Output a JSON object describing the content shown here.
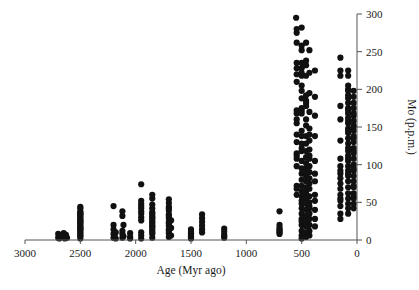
{
  "chart_data": {
    "type": "scatter",
    "title": "",
    "xlabel": "Age (Myr ago)",
    "ylabel": "Mo (p.p.m.)",
    "xlim": [
      3000,
      0
    ],
    "ylim": [
      0,
      300
    ],
    "x_reversed": true,
    "grid": false,
    "legend": null,
    "xticks": [
      3000,
      2500,
      2000,
      1500,
      1000,
      500,
      0
    ],
    "yticks": [
      0,
      50,
      100,
      150,
      200,
      250,
      300
    ],
    "xtick_labels": [
      "3000",
      "2500",
      "2000",
      "1500",
      "1000",
      "500",
      "0"
    ],
    "ytick_labels": [
      "0",
      "50",
      "100",
      "150",
      "200",
      "250",
      "300"
    ],
    "y_axis_position": "right",
    "marker": "filled-circle",
    "marker_color": "#111111",
    "marker_size": 3.1,
    "series": [
      {
        "name": "Mo concentration in black shales",
        "points": [
          [
            2700,
            3
          ],
          [
            2700,
            8
          ],
          [
            2690,
            2
          ],
          [
            2680,
            6
          ],
          [
            2660,
            4
          ],
          [
            2650,
            9
          ],
          [
            2640,
            2
          ],
          [
            2630,
            7
          ],
          [
            2620,
            3
          ],
          [
            2500,
            2
          ],
          [
            2500,
            6
          ],
          [
            2500,
            10
          ],
          [
            2500,
            14
          ],
          [
            2500,
            18
          ],
          [
            2500,
            22
          ],
          [
            2500,
            26
          ],
          [
            2500,
            30
          ],
          [
            2500,
            34
          ],
          [
            2500,
            38
          ],
          [
            2500,
            42
          ],
          [
            2500,
            8
          ],
          [
            2500,
            16
          ],
          [
            2500,
            24
          ],
          [
            2500,
            32
          ],
          [
            2500,
            12
          ],
          [
            2500,
            20
          ],
          [
            2500,
            28
          ],
          [
            2500,
            36
          ],
          [
            2500,
            44
          ],
          [
            2500,
            5
          ],
          [
            2500,
            15
          ],
          [
            2500,
            25
          ],
          [
            2500,
            35
          ],
          [
            2200,
            3
          ],
          [
            2200,
            8
          ],
          [
            2200,
            14
          ],
          [
            2200,
            20
          ],
          [
            2200,
            45
          ],
          [
            2190,
            5
          ],
          [
            2180,
            2
          ],
          [
            2180,
            10
          ],
          [
            2120,
            3
          ],
          [
            2120,
            8
          ],
          [
            2120,
            12
          ],
          [
            2120,
            32
          ],
          [
            2120,
            38
          ],
          [
            2110,
            5
          ],
          [
            2110,
            20
          ],
          [
            2050,
            4
          ],
          [
            2050,
            9
          ],
          [
            2050,
            2
          ],
          [
            1950,
            2
          ],
          [
            1950,
            6
          ],
          [
            1950,
            10
          ],
          [
            1950,
            30
          ],
          [
            1950,
            35
          ],
          [
            1950,
            42
          ],
          [
            1950,
            48
          ],
          [
            1950,
            52
          ],
          [
            1950,
            74
          ],
          [
            1950,
            26
          ],
          [
            1950,
            38
          ],
          [
            1950,
            45
          ],
          [
            1850,
            3
          ],
          [
            1850,
            8
          ],
          [
            1850,
            13
          ],
          [
            1850,
            18
          ],
          [
            1850,
            23
          ],
          [
            1850,
            28
          ],
          [
            1850,
            32
          ],
          [
            1850,
            37
          ],
          [
            1850,
            42
          ],
          [
            1850,
            47
          ],
          [
            1850,
            55
          ],
          [
            1850,
            60
          ],
          [
            1850,
            10
          ],
          [
            1850,
            20
          ],
          [
            1850,
            30
          ],
          [
            1850,
            16
          ],
          [
            1850,
            25
          ],
          [
            1850,
            35
          ],
          [
            1700,
            4
          ],
          [
            1700,
            9
          ],
          [
            1700,
            14
          ],
          [
            1700,
            19
          ],
          [
            1700,
            24
          ],
          [
            1700,
            29
          ],
          [
            1700,
            34
          ],
          [
            1700,
            39
          ],
          [
            1700,
            44
          ],
          [
            1700,
            49
          ],
          [
            1700,
            54
          ],
          [
            1700,
            12
          ],
          [
            1700,
            22
          ],
          [
            1700,
            32
          ],
          [
            1700,
            42
          ],
          [
            1680,
            6
          ],
          [
            1680,
            16
          ],
          [
            1680,
            26
          ],
          [
            1500,
            2
          ],
          [
            1500,
            5
          ],
          [
            1500,
            8
          ],
          [
            1500,
            11
          ],
          [
            1500,
            14
          ],
          [
            1500,
            4
          ],
          [
            1500,
            9
          ],
          [
            1400,
            14
          ],
          [
            1400,
            19
          ],
          [
            1400,
            24
          ],
          [
            1400,
            29
          ],
          [
            1400,
            34
          ],
          [
            1400,
            10
          ],
          [
            1200,
            3
          ],
          [
            1200,
            7
          ],
          [
            1200,
            11
          ],
          [
            1200,
            15
          ],
          [
            1200,
            5
          ],
          [
            700,
            8
          ],
          [
            700,
            12
          ],
          [
            700,
            16
          ],
          [
            700,
            20
          ],
          [
            700,
            38
          ],
          [
            700,
            10
          ],
          [
            700,
            14
          ],
          [
            550,
            295
          ],
          [
            545,
            280
          ],
          [
            545,
            275
          ],
          [
            545,
            262
          ],
          [
            545,
            235
          ],
          [
            545,
            228
          ],
          [
            545,
            210
          ],
          [
            545,
            172
          ],
          [
            545,
            168
          ],
          [
            545,
            155
          ],
          [
            545,
            140
          ],
          [
            545,
            130
          ],
          [
            545,
            112
          ],
          [
            545,
            108
          ],
          [
            545,
            98
          ],
          [
            545,
            72
          ],
          [
            545,
            68
          ],
          [
            545,
            60
          ],
          [
            545,
            115
          ],
          [
            545,
            160
          ],
          [
            545,
            220
          ],
          [
            500,
            282
          ],
          [
            500,
            258
          ],
          [
            500,
            252
          ],
          [
            500,
            235
          ],
          [
            500,
            228
          ],
          [
            500,
            222
          ],
          [
            500,
            218
          ],
          [
            500,
            205
          ],
          [
            500,
            198
          ],
          [
            500,
            188
          ],
          [
            500,
            175
          ],
          [
            500,
            172
          ],
          [
            500,
            168
          ],
          [
            500,
            128
          ],
          [
            500,
            122
          ],
          [
            500,
            118
          ],
          [
            500,
            105
          ],
          [
            500,
            95
          ],
          [
            500,
            88
          ],
          [
            500,
            80
          ],
          [
            500,
            72
          ],
          [
            500,
            65
          ],
          [
            500,
            58
          ],
          [
            500,
            48
          ],
          [
            500,
            42
          ],
          [
            500,
            35
          ],
          [
            500,
            28
          ],
          [
            500,
            20
          ],
          [
            500,
            12
          ],
          [
            500,
            6
          ],
          [
            500,
            2
          ],
          [
            500,
            145
          ],
          [
            500,
            138
          ],
          [
            500,
            52
          ],
          [
            500,
            25
          ],
          [
            460,
            262
          ],
          [
            460,
            238
          ],
          [
            460,
            232
          ],
          [
            460,
            218
          ],
          [
            460,
            192
          ],
          [
            460,
            185
          ],
          [
            460,
            182
          ],
          [
            460,
            178
          ],
          [
            460,
            160
          ],
          [
            460,
            152
          ],
          [
            460,
            138
          ],
          [
            460,
            128
          ],
          [
            460,
            118
          ],
          [
            460,
            110
          ],
          [
            460,
            102
          ],
          [
            460,
            95
          ],
          [
            460,
            85
          ],
          [
            460,
            78
          ],
          [
            460,
            70
          ],
          [
            460,
            62
          ],
          [
            460,
            55
          ],
          [
            460,
            48
          ],
          [
            460,
            40
          ],
          [
            460,
            32
          ],
          [
            460,
            25
          ],
          [
            460,
            18
          ],
          [
            460,
            10
          ],
          [
            460,
            4
          ],
          [
            460,
            88
          ],
          [
            460,
            65
          ],
          [
            430,
            252
          ],
          [
            430,
            222
          ],
          [
            430,
            195
          ],
          [
            430,
            170
          ],
          [
            430,
            148
          ],
          [
            430,
            140
          ],
          [
            430,
            132
          ],
          [
            430,
            120
          ],
          [
            430,
            108
          ],
          [
            430,
            98
          ],
          [
            430,
            90
          ],
          [
            430,
            82
          ],
          [
            430,
            75
          ],
          [
            430,
            68
          ],
          [
            430,
            58
          ],
          [
            430,
            50
          ],
          [
            430,
            42
          ],
          [
            430,
            35
          ],
          [
            430,
            28
          ],
          [
            430,
            20
          ],
          [
            430,
            12
          ],
          [
            430,
            6
          ],
          [
            430,
            112
          ],
          [
            430,
            45
          ],
          [
            380,
            225
          ],
          [
            380,
            190
          ],
          [
            380,
            165
          ],
          [
            380,
            138
          ],
          [
            380,
            105
          ],
          [
            380,
            78
          ],
          [
            380,
            52
          ],
          [
            380,
            40
          ],
          [
            380,
            28
          ],
          [
            380,
            18
          ],
          [
            380,
            60
          ],
          [
            380,
            88
          ],
          [
            150,
            242
          ],
          [
            150,
            225
          ],
          [
            150,
            218
          ],
          [
            150,
            178
          ],
          [
            150,
            160
          ],
          [
            150,
            132
          ],
          [
            150,
            108
          ],
          [
            150,
            98
          ],
          [
            150,
            88
          ],
          [
            150,
            82
          ],
          [
            150,
            75
          ],
          [
            150,
            68
          ],
          [
            150,
            60
          ],
          [
            150,
            52
          ],
          [
            150,
            45
          ],
          [
            150,
            35
          ],
          [
            150,
            28
          ],
          [
            150,
            55
          ],
          [
            150,
            92
          ],
          [
            80,
            225
          ],
          [
            80,
            218
          ],
          [
            80,
            205
          ],
          [
            80,
            198
          ],
          [
            80,
            192
          ],
          [
            80,
            188
          ],
          [
            80,
            182
          ],
          [
            80,
            175
          ],
          [
            80,
            168
          ],
          [
            80,
            162
          ],
          [
            80,
            155
          ],
          [
            80,
            148
          ],
          [
            80,
            142
          ],
          [
            80,
            135
          ],
          [
            80,
            128
          ],
          [
            80,
            118
          ],
          [
            80,
            112
          ],
          [
            80,
            105
          ],
          [
            80,
            98
          ],
          [
            80,
            92
          ],
          [
            80,
            85
          ],
          [
            80,
            78
          ],
          [
            80,
            70
          ],
          [
            80,
            62
          ],
          [
            80,
            55
          ],
          [
            80,
            48
          ],
          [
            80,
            42
          ],
          [
            80,
            35
          ],
          [
            80,
            200
          ],
          [
            80,
            172
          ],
          [
            80,
            158
          ],
          [
            80,
            145
          ],
          [
            80,
            122
          ],
          [
            80,
            108
          ],
          [
            80,
            88
          ],
          [
            30,
            198
          ],
          [
            30,
            190
          ],
          [
            30,
            182
          ],
          [
            30,
            175
          ],
          [
            30,
            165
          ],
          [
            30,
            158
          ],
          [
            30,
            150
          ],
          [
            30,
            145
          ],
          [
            30,
            138
          ],
          [
            30,
            130
          ],
          [
            30,
            122
          ],
          [
            30,
            115
          ],
          [
            30,
            108
          ],
          [
            30,
            100
          ],
          [
            30,
            92
          ],
          [
            30,
            85
          ],
          [
            30,
            78
          ],
          [
            30,
            70
          ],
          [
            30,
            62
          ],
          [
            30,
            55
          ],
          [
            30,
            48
          ],
          [
            30,
            42
          ],
          [
            30,
            168
          ],
          [
            30,
            152
          ],
          [
            30,
            135
          ],
          [
            30,
            118
          ],
          [
            30,
            95
          ],
          [
            30,
            72
          ],
          [
            30,
            58
          ]
        ]
      }
    ]
  },
  "caption": {
    "sliver_text": ""
  }
}
